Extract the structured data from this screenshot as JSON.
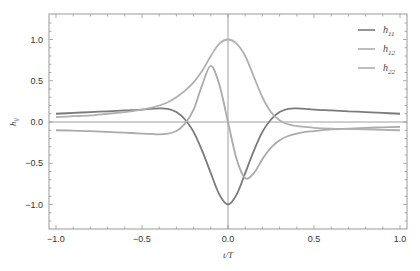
{
  "chart_data": {
    "type": "line",
    "title": "",
    "xlabel": "t/T",
    "ylabel": "h_ij",
    "xlim": [
      -1.0,
      1.0
    ],
    "ylim": [
      -1.3,
      1.3
    ],
    "xticks": [
      "-1.0",
      "-0.5",
      "0.0",
      "0.5",
      "1.0"
    ],
    "yticks": [
      "1.0",
      "0.5",
      "0.0",
      "-0.5",
      "-1.0"
    ],
    "grid": false,
    "legend_position": "top-right",
    "x": [
      -1.0,
      -0.9,
      -0.8,
      -0.7,
      -0.6,
      -0.5,
      -0.45,
      -0.4,
      -0.35,
      -0.3,
      -0.25,
      -0.2,
      -0.15,
      -0.1,
      -0.05,
      0.0,
      0.05,
      0.1,
      0.15,
      0.2,
      0.25,
      0.3,
      0.35,
      0.4,
      0.45,
      0.5,
      0.6,
      0.7,
      0.8,
      0.9,
      1.0
    ],
    "series": [
      {
        "name": "h11",
        "sub": "11",
        "color": "#7a7a7a",
        "values": [
          0.1,
          0.11,
          0.12,
          0.13,
          0.14,
          0.15,
          0.16,
          0.165,
          0.16,
          0.12,
          0.03,
          -0.12,
          -0.35,
          -0.62,
          -0.88,
          -1.0,
          -0.88,
          -0.62,
          -0.35,
          -0.12,
          0.03,
          0.12,
          0.16,
          0.165,
          0.16,
          0.15,
          0.14,
          0.13,
          0.12,
          0.11,
          0.1
        ]
      },
      {
        "name": "h12",
        "sub": "12",
        "color": "#ababab",
        "values": [
          -0.1,
          -0.105,
          -0.11,
          -0.12,
          -0.13,
          -0.14,
          -0.145,
          -0.15,
          -0.14,
          -0.11,
          -0.02,
          0.15,
          0.45,
          0.68,
          0.45,
          0.0,
          -0.45,
          -0.68,
          -0.62,
          -0.45,
          -0.31,
          -0.22,
          -0.17,
          -0.14,
          -0.12,
          -0.11,
          -0.09,
          -0.08,
          -0.07,
          -0.065,
          -0.06
        ]
      },
      {
        "name": "h22",
        "sub": "22",
        "color": "#b0b0b0",
        "values": [
          0.06,
          0.07,
          0.08,
          0.1,
          0.12,
          0.15,
          0.17,
          0.2,
          0.24,
          0.3,
          0.38,
          0.48,
          0.62,
          0.8,
          0.95,
          1.0,
          0.95,
          0.8,
          0.55,
          0.3,
          0.12,
          0.02,
          -0.03,
          -0.05,
          -0.06,
          -0.07,
          -0.08,
          -0.085,
          -0.09,
          -0.095,
          -0.1
        ]
      }
    ]
  },
  "plot": {
    "left": 49,
    "top": 14,
    "right": 407,
    "bottom": 229
  }
}
